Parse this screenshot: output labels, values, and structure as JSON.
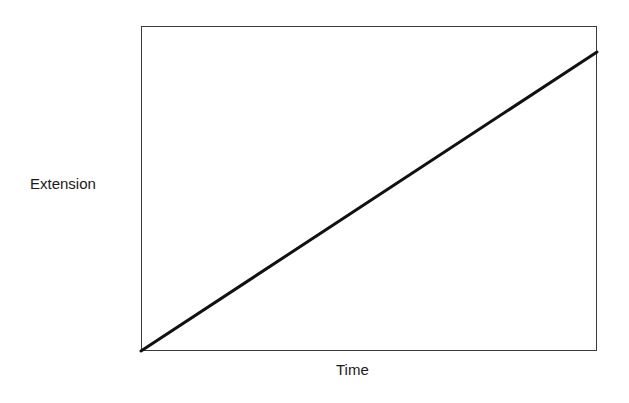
{
  "chart_data": {
    "type": "line",
    "title": "",
    "xlabel": "Time",
    "ylabel": "Extension",
    "x_ticks": [],
    "y_ticks": [],
    "xlim": [
      0,
      1
    ],
    "ylim": [
      0,
      1
    ],
    "grid": false,
    "legend": null,
    "series": [
      {
        "name": "Extension vs Time",
        "x": [
          0,
          1
        ],
        "y": [
          0,
          0.92
        ],
        "color": "#111111"
      }
    ]
  },
  "colors": {
    "line": "#111111",
    "frame": "#3a3a3a",
    "text": "#1a1a1a",
    "background": "#ffffff"
  }
}
